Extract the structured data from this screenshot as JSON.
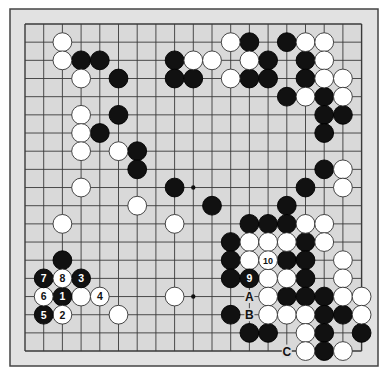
{
  "diagram": {
    "type": "go-board",
    "size": 19,
    "colors": {
      "board": "#d6d6d6",
      "frame": "#e4e4e4",
      "line": "#3a3a3a",
      "black": "#111111",
      "white": "#ffffff"
    },
    "black_stones": [
      [
        3,
        2
      ],
      [
        4,
        2
      ],
      [
        5,
        3
      ],
      [
        5,
        5
      ],
      [
        4,
        6
      ],
      [
        6,
        7
      ],
      [
        6,
        8
      ],
      [
        8,
        2
      ],
      [
        8,
        3
      ],
      [
        9,
        3
      ],
      [
        12,
        1
      ],
      [
        12,
        3
      ],
      [
        13,
        2
      ],
      [
        13,
        3
      ],
      [
        14,
        1
      ],
      [
        15,
        2
      ],
      [
        15,
        3
      ],
      [
        14,
        4
      ],
      [
        16,
        4
      ],
      [
        16,
        5
      ],
      [
        17,
        5
      ],
      [
        16,
        6
      ],
      [
        16,
        8
      ],
      [
        15,
        9
      ],
      [
        14,
        10
      ],
      [
        8,
        9
      ],
      [
        10,
        10
      ],
      [
        12,
        11
      ],
      [
        13,
        11
      ],
      [
        14,
        11
      ],
      [
        11,
        12
      ],
      [
        15,
        12
      ],
      [
        11,
        13
      ],
      [
        14,
        13
      ],
      [
        15,
        13
      ],
      [
        11,
        14
      ],
      [
        15,
        14
      ],
      [
        14,
        15
      ],
      [
        15,
        15
      ],
      [
        16,
        15
      ],
      [
        11,
        16
      ],
      [
        16,
        16
      ],
      [
        17,
        16
      ],
      [
        12,
        17
      ],
      [
        13,
        17
      ],
      [
        16,
        17
      ],
      [
        18,
        17
      ],
      [
        16,
        18
      ],
      [
        2,
        13
      ]
    ],
    "white_stones": [
      [
        2,
        1
      ],
      [
        2,
        2
      ],
      [
        3,
        3
      ],
      [
        3,
        5
      ],
      [
        3,
        6
      ],
      [
        3,
        7
      ],
      [
        5,
        7
      ],
      [
        3,
        9
      ],
      [
        6,
        10
      ],
      [
        2,
        11
      ],
      [
        9,
        2
      ],
      [
        10,
        2
      ],
      [
        11,
        1
      ],
      [
        11,
        3
      ],
      [
        12,
        2
      ],
      [
        15,
        1
      ],
      [
        16,
        1
      ],
      [
        16,
        2
      ],
      [
        16,
        3
      ],
      [
        17,
        3
      ],
      [
        15,
        4
      ],
      [
        17,
        4
      ],
      [
        17,
        8
      ],
      [
        17,
        9
      ],
      [
        8,
        11
      ],
      [
        15,
        11
      ],
      [
        16,
        11
      ],
      [
        12,
        12
      ],
      [
        13,
        12
      ],
      [
        14,
        12
      ],
      [
        16,
        12
      ],
      [
        12,
        13
      ],
      [
        17,
        13
      ],
      [
        13,
        14
      ],
      [
        14,
        14
      ],
      [
        17,
        14
      ],
      [
        13,
        15
      ],
      [
        17,
        15
      ],
      [
        18,
        15
      ],
      [
        13,
        16
      ],
      [
        14,
        16
      ],
      [
        15,
        16
      ],
      [
        18,
        16
      ],
      [
        15,
        17
      ],
      [
        15,
        18
      ],
      [
        17,
        18
      ],
      [
        3,
        15
      ],
      [
        5,
        16
      ],
      [
        8,
        15
      ]
    ],
    "numbered_moves": [
      {
        "n": "1",
        "color": "black",
        "pos": [
          2,
          15
        ]
      },
      {
        "n": "2",
        "color": "white",
        "pos": [
          2,
          16
        ]
      },
      {
        "n": "3",
        "color": "black",
        "pos": [
          3,
          14
        ]
      },
      {
        "n": "4",
        "color": "white",
        "pos": [
          4,
          15
        ]
      },
      {
        "n": "5",
        "color": "black",
        "pos": [
          1,
          16
        ]
      },
      {
        "n": "6",
        "color": "white",
        "pos": [
          1,
          15
        ]
      },
      {
        "n": "7",
        "color": "black",
        "pos": [
          1,
          14
        ]
      },
      {
        "n": "8",
        "color": "white",
        "pos": [
          2,
          14
        ]
      },
      {
        "n": "9",
        "color": "black",
        "pos": [
          12,
          14
        ]
      },
      {
        "n": "10",
        "color": "white",
        "pos": [
          13,
          13
        ]
      }
    ],
    "letter_labels": [
      {
        "label": "A",
        "pos": [
          12,
          15
        ]
      },
      {
        "label": "B",
        "pos": [
          12,
          16
        ]
      },
      {
        "label": "C",
        "pos": [
          14,
          18
        ]
      }
    ],
    "star_points_visible": [
      [
        9,
        9
      ],
      [
        9,
        15
      ]
    ]
  }
}
